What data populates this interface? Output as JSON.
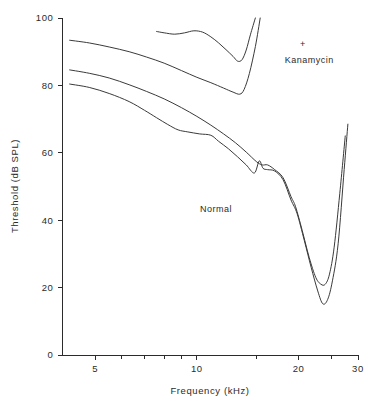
{
  "chart_data": {
    "type": "line",
    "title": "",
    "xlabel": "Frequency (kHz)",
    "ylabel": "Threshold (dB SPL)",
    "xscale": "log",
    "yscale": "linear",
    "xlim": [
      4.0,
      30.0
    ],
    "ylim": [
      0,
      100
    ],
    "grid": false,
    "legend_position": "none",
    "x_tick_labels": [
      "5",
      "10",
      "20",
      "30"
    ],
    "x_tick_values": [
      5,
      10,
      20,
      30
    ],
    "x_minor_tick_values": [
      6,
      7,
      8,
      9,
      15,
      25
    ],
    "y_tick_labels": [
      "0",
      "20",
      "40",
      "60",
      "80",
      "100"
    ],
    "y_tick_values": [
      0,
      20,
      40,
      60,
      80,
      100
    ],
    "annotations": [
      {
        "text": "+",
        "x": 20.6,
        "y": 91.5,
        "name": "plus-symbol"
      },
      {
        "text": "Kanamycin",
        "x": 21.5,
        "y": 86.5,
        "name": "kanamycin-label"
      },
      {
        "text": "Normal",
        "x": 11.4,
        "y": 42.5,
        "name": "normal-label"
      }
    ],
    "series": [
      {
        "name": "Kanamycin upper",
        "group": "kanamycin",
        "x": [
          7.6,
          8.0,
          8.6,
          9.2,
          9.8,
          10.4,
          11.0,
          11.6,
          12.2,
          12.8,
          13.2,
          13.6,
          14.0,
          14.4,
          14.9
        ],
        "y": [
          96.0,
          95.6,
          95.2,
          95.6,
          96.2,
          95.8,
          94.4,
          92.6,
          90.6,
          88.6,
          87.2,
          87.6,
          90.5,
          95.0,
          100.0
        ]
      },
      {
        "name": "Kanamycin lower",
        "group": "kanamycin",
        "x": [
          4.2,
          4.8,
          5.5,
          6.3,
          7.1,
          8.0,
          9.0,
          10.0,
          11.0,
          12.0,
          12.8,
          13.4,
          13.8,
          14.3,
          14.9,
          15.4
        ],
        "y": [
          93.4,
          92.6,
          91.4,
          90.0,
          88.4,
          86.6,
          84.4,
          82.4,
          80.8,
          79.2,
          78.0,
          77.4,
          78.8,
          83.5,
          91.5,
          100.0
        ]
      },
      {
        "name": "Normal upper",
        "group": "normal",
        "x": [
          4.2,
          4.8,
          5.5,
          6.3,
          7.1,
          8.0,
          9.0,
          10.0,
          11.0,
          12.0,
          13.0,
          14.0,
          15.0,
          15.6,
          16.2,
          17.0,
          18.0,
          19.0,
          19.6,
          20.5,
          21.5,
          22.5,
          23.3,
          24.0,
          24.7,
          25.5,
          26.5,
          27.5
        ],
        "y": [
          84.6,
          83.6,
          82.2,
          80.2,
          78.2,
          76.0,
          73.4,
          70.8,
          68.2,
          65.6,
          63.0,
          60.2,
          57.4,
          56.4,
          56.4,
          55.0,
          52.6,
          47.0,
          44.0,
          37.0,
          29.0,
          23.0,
          21.0,
          21.0,
          24.0,
          32.0,
          48.0,
          65.0
        ]
      },
      {
        "name": "Normal lower",
        "group": "normal",
        "x": [
          4.2,
          4.8,
          5.5,
          6.3,
          7.0,
          7.6,
          8.2,
          8.8,
          9.4,
          10.2,
          11.0,
          11.6,
          12.4,
          13.2,
          14.0,
          14.8,
          15.3,
          15.7,
          16.2,
          17.0,
          18.0,
          19.0,
          19.8,
          20.8,
          21.8,
          22.8,
          23.6,
          24.4,
          25.2,
          26.2,
          27.3,
          28.0
        ],
        "y": [
          80.4,
          79.4,
          77.6,
          75.2,
          72.6,
          70.4,
          68.4,
          66.8,
          66.2,
          65.6,
          65.2,
          63.4,
          61.2,
          58.8,
          56.4,
          54.0,
          57.6,
          55.4,
          55.0,
          54.6,
          52.0,
          46.0,
          42.0,
          34.0,
          26.0,
          19.0,
          15.2,
          16.5,
          22.0,
          33.0,
          55.0,
          68.5
        ]
      }
    ]
  },
  "figure": {
    "caption": ""
  }
}
